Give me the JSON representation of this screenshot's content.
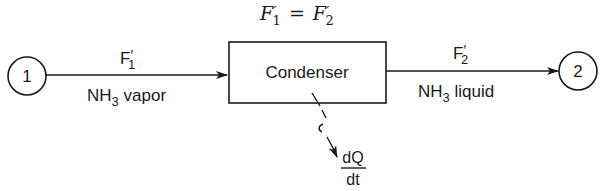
{
  "equation": {
    "lhs": "F",
    "lhs_prime": "′",
    "lhs_sub": "1",
    "op": "=",
    "rhs": "F",
    "rhs_prime": "′",
    "rhs_sub": "2"
  },
  "nodes": {
    "source": {
      "label": "1"
    },
    "sink": {
      "label": "2"
    },
    "unit": {
      "label": "Condenser"
    }
  },
  "streams": {
    "inlet": {
      "flow": "F",
      "prime": "′",
      "sub": "1",
      "species": "NH",
      "species_sub": "3",
      "phase": " vapor"
    },
    "outlet": {
      "flow": "F",
      "prime": "′",
      "sub": "2",
      "species": "NH",
      "species_sub": "3",
      "phase": " liquid"
    }
  },
  "heat": {
    "numerator": "dQ",
    "denominator": "dt"
  },
  "colors": {
    "ink": "#1a1a1a",
    "background": "#ffffff"
  }
}
